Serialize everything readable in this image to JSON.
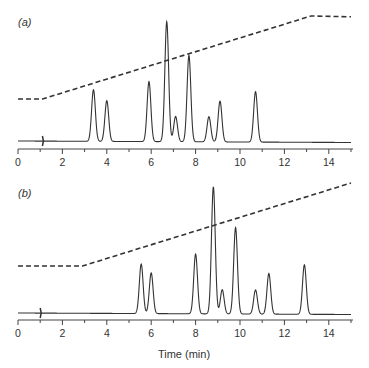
{
  "chart_data": [
    {
      "type": "line",
      "panel_label": "(a)",
      "xlabel": "",
      "ylabel": "",
      "xlim": [
        0,
        15
      ],
      "x_ticks": [
        0,
        2,
        4,
        6,
        8,
        10,
        12,
        14
      ],
      "grid": false,
      "injection_marker_time": 1.1,
      "peaks": [
        {
          "time": 3.4,
          "rel_height": 0.43
        },
        {
          "time": 4.0,
          "rel_height": 0.34
        },
        {
          "time": 5.9,
          "rel_height": 0.5
        },
        {
          "time": 6.7,
          "rel_height": 1.0
        },
        {
          "time": 7.1,
          "rel_height": 0.21
        },
        {
          "time": 7.7,
          "rel_height": 0.72
        },
        {
          "time": 8.6,
          "rel_height": 0.21
        },
        {
          "time": 9.1,
          "rel_height": 0.34
        },
        {
          "time": 10.7,
          "rel_height": 0.42
        }
      ],
      "gradient_profile": {
        "style": "dashed",
        "points": [
          [
            0,
            0.0
          ],
          [
            1.1,
            0.0
          ],
          [
            13.2,
            1.0
          ],
          [
            15,
            0.99
          ]
        ]
      }
    },
    {
      "type": "line",
      "panel_label": "(b)",
      "xlabel": "Time (min)",
      "ylabel": "",
      "xlim": [
        0,
        15
      ],
      "x_ticks": [
        0,
        2,
        4,
        6,
        8,
        10,
        12,
        14
      ],
      "grid": false,
      "injection_marker_time": 1.0,
      "peaks": [
        {
          "time": 5.55,
          "rel_height": 0.39
        },
        {
          "time": 6.0,
          "rel_height": 0.32
        },
        {
          "time": 8.0,
          "rel_height": 0.47
        },
        {
          "time": 8.8,
          "rel_height": 1.0
        },
        {
          "time": 9.2,
          "rel_height": 0.19
        },
        {
          "time": 9.8,
          "rel_height": 0.68
        },
        {
          "time": 10.7,
          "rel_height": 0.19
        },
        {
          "time": 11.3,
          "rel_height": 0.32
        },
        {
          "time": 12.9,
          "rel_height": 0.39
        }
      ],
      "gradient_profile": {
        "style": "dashed",
        "points": [
          [
            0,
            0.0
          ],
          [
            2.9,
            0.0
          ],
          [
            15,
            1.0
          ]
        ]
      }
    }
  ],
  "panels": {
    "a": {
      "label": "(a)"
    },
    "b": {
      "label": "(b)"
    }
  },
  "axis": {
    "ticks": [
      "0",
      "2",
      "4",
      "6",
      "8",
      "10",
      "12",
      "14"
    ],
    "xlabel": "Time (min)"
  }
}
